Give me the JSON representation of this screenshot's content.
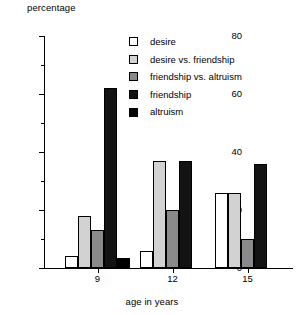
{
  "chart_data": {
    "type": "bar",
    "title": "",
    "ylabel": "percentage",
    "xlabel": "age in years",
    "categories": [
      "9",
      "12",
      "15"
    ],
    "ylim": [
      0,
      80
    ],
    "yticks": [
      0,
      20,
      40,
      60,
      80
    ],
    "yticks_minor": [
      10,
      30,
      50,
      70
    ],
    "grid": false,
    "legend_position": "upper-right-inside",
    "series": [
      {
        "name": "desire",
        "color": "#ffffff",
        "values": [
          4,
          6,
          26
        ]
      },
      {
        "name": "desire vs. friendship",
        "color": "#d2d2d2",
        "values": [
          18,
          37,
          26
        ]
      },
      {
        "name": "friendship vs. altruism",
        "color": "#8a8a8a",
        "values": [
          13,
          20,
          10
        ]
      },
      {
        "name": "friendship",
        "color": "#131313",
        "values": [
          62,
          37,
          36
        ]
      },
      {
        "name": "altruism",
        "color": "#000000",
        "values": [
          3.5,
          0,
          0
        ]
      }
    ]
  },
  "axes": {
    "y_title": "percentage",
    "x_title": "age in years",
    "y_tick_labels": [
      "0",
      "20",
      "40",
      "60",
      "80"
    ],
    "x_tick_labels": [
      "9",
      "12",
      "15"
    ]
  },
  "legend": {
    "items": [
      {
        "label": "desire",
        "swatch": "#ffffff"
      },
      {
        "label": "desire vs. friendship",
        "swatch": "#d2d2d2"
      },
      {
        "label": "friendship vs. altruism",
        "swatch": "#8a8a8a"
      },
      {
        "label": "friendship",
        "swatch": "#131313"
      },
      {
        "label": "altruism",
        "swatch": "#000000"
      }
    ]
  }
}
